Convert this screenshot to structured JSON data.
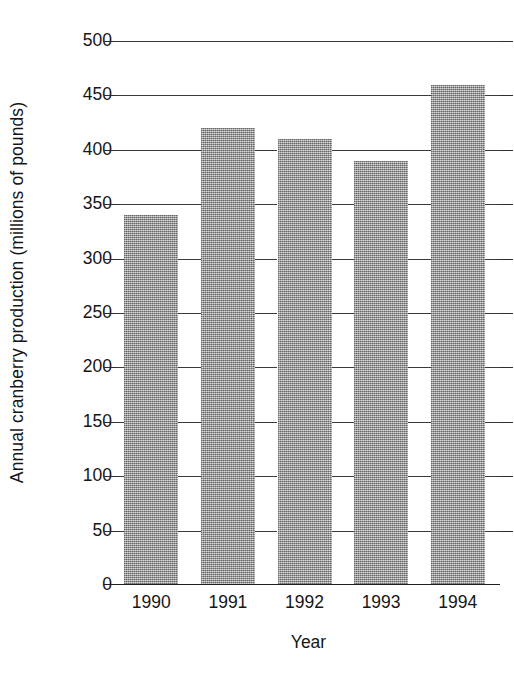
{
  "chart_data": {
    "type": "bar",
    "title": "",
    "categories": [
      "1990",
      "1991",
      "1992",
      "1993",
      "1994"
    ],
    "values": [
      340,
      420,
      410,
      390,
      460
    ],
    "series": [
      {
        "name": "Annual cranberry production",
        "values": [
          340,
          420,
          410,
          390,
          460
        ]
      }
    ],
    "xlabel": "Year",
    "ylabel": "Annual cranberry production (millions of pounds)",
    "ylim": [
      0,
      500
    ],
    "ytick_values": [
      0,
      50,
      100,
      150,
      200,
      250,
      300,
      350,
      400,
      450,
      500
    ],
    "ytick_labels": [
      "0",
      "50",
      "100",
      "150",
      "200",
      "250",
      "300",
      "350",
      "400",
      "450",
      "500"
    ],
    "ytick_step": 50,
    "grid": "horizontal",
    "legend": "none",
    "bar_color": "#9b9b9b",
    "axis_color": "#1f1f1f",
    "text_color": "#161616",
    "background": "#ffffff"
  }
}
